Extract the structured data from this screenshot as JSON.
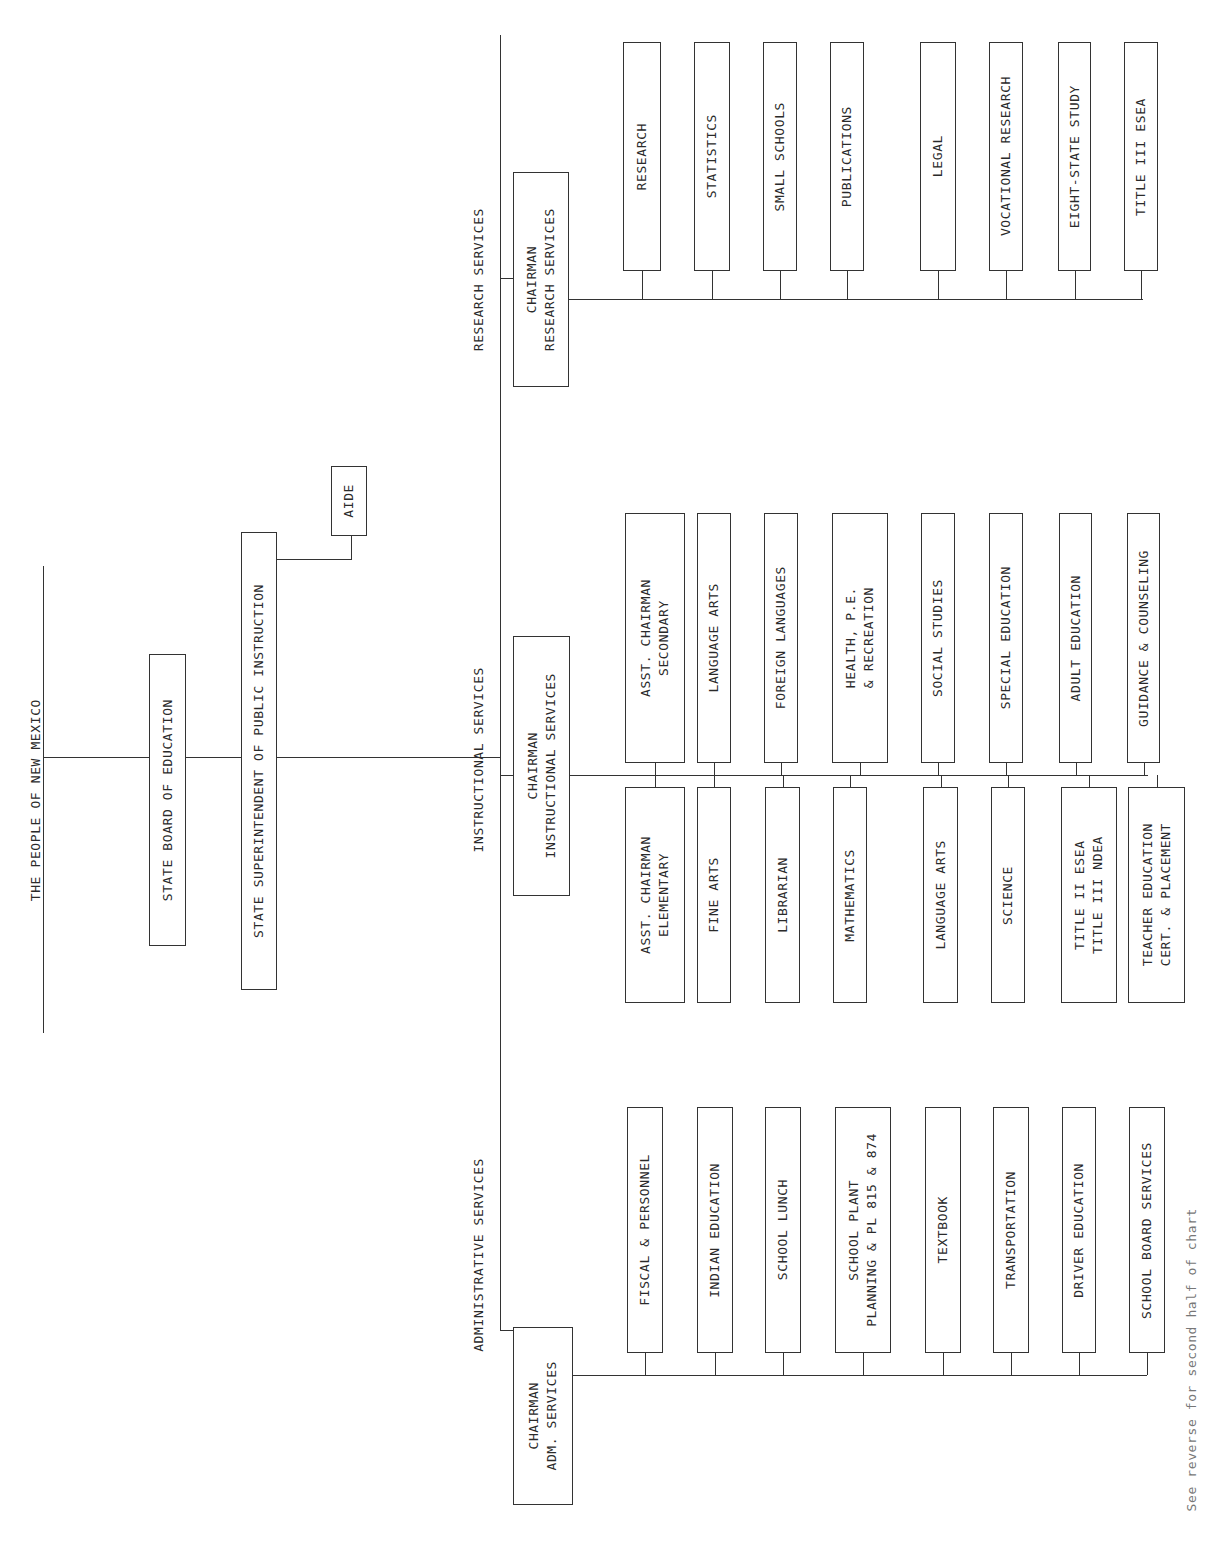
{
  "title": "THE PEOPLE OF NEW MEXICO",
  "state_board": "STATE BOARD OF EDUCATION",
  "superintendent": "STATE SUPERINTENDENT OF PUBLIC INSTRUCTION",
  "aide": "AIDE",
  "sections": {
    "research": {
      "label": "RESEARCH SERVICES",
      "chairman": "CHAIRMAN\nRESEARCH SERVICES",
      "items": [
        "RESEARCH",
        "STATISTICS",
        "SMALL SCHOOLS",
        "PUBLICATIONS",
        "LEGAL",
        "VOCATIONAL RESEARCH",
        "EIGHT-STATE STUDY",
        "TITLE III ESEA"
      ]
    },
    "instructional": {
      "label": "INSTRUCTIONAL SERVICES",
      "chairman": "CHAIRMAN\nINSTRUCTIONAL SERVICES",
      "upper_items": [
        "ASST. CHAIRMAN\nSECONDARY",
        "LANGUAGE ARTS",
        "FOREIGN LANGUAGES",
        "HEALTH, P.E.\n& RECREATION",
        "SOCIAL STUDIES",
        "SPECIAL EDUCATION",
        "ADULT EDUCATION",
        "GUIDANCE & COUNSELING"
      ],
      "lower_items": [
        "ASST. CHAIRMAN\nELEMENTARY",
        "FINE ARTS",
        "LIBRARIAN",
        "MATHEMATICS",
        "LANGUAGE ARTS",
        "SCIENCE",
        "TITLE II ESEA\nTITLE III NDEA",
        "TEACHER EDUCATION\nCERT. & PLACEMENT"
      ]
    },
    "administrative": {
      "label": "ADMINISTRATIVE SERVICES",
      "chairman": "CHAIRMAN\nADM. SERVICES",
      "items": [
        "FISCAL & PERSONNEL",
        "INDIAN EDUCATION",
        "SCHOOL LUNCH",
        "SCHOOL PLANT\nPLANNING & PL 815 & 874",
        "TEXTBOOK",
        "TRANSPORTATION",
        "DRIVER EDUCATION",
        "SCHOOL BOARD SERVICES"
      ]
    }
  },
  "footnote": "See reverse for second half of chart"
}
